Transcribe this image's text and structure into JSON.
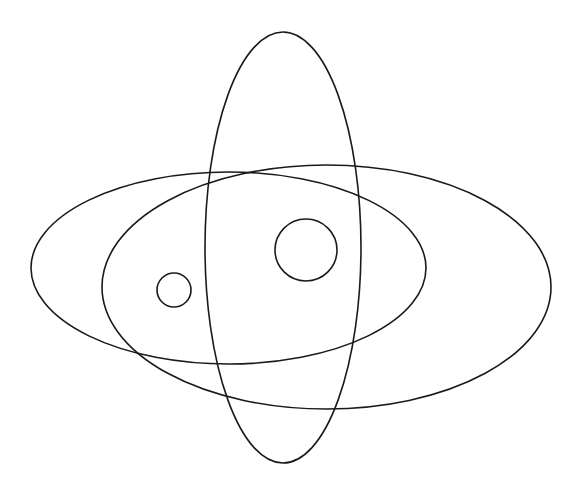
{
  "diagram": {
    "type": "overlapping-ellipses",
    "background": "#ffffff",
    "stroke_color": "#1a1a1a",
    "shapes": [
      {
        "id": "ellipse-left-horizontal",
        "kind": "ellipse",
        "cx": 228.5,
        "cy": 268,
        "rx": 197.5,
        "ry": 96
      },
      {
        "id": "ellipse-right-horizontal",
        "kind": "ellipse",
        "cx": 326.5,
        "cy": 287,
        "rx": 224.5,
        "ry": 122
      },
      {
        "id": "ellipse-vertical",
        "kind": "ellipse",
        "cx": 283,
        "cy": 247.5,
        "rx": 78,
        "ry": 215.5
      },
      {
        "id": "circle-small",
        "kind": "circle",
        "cx": 174,
        "cy": 290,
        "r": 17
      },
      {
        "id": "circle-large",
        "kind": "circle",
        "cx": 306,
        "cy": 250,
        "r": 31
      }
    ]
  }
}
